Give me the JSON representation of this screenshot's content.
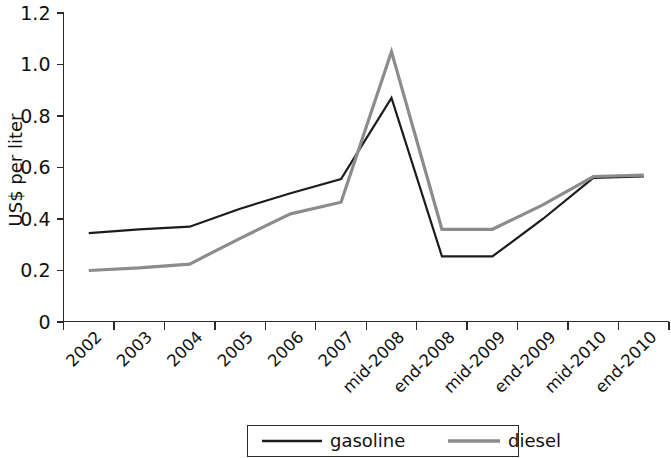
{
  "chart_data": {
    "type": "line",
    "title": "",
    "subtitle": "",
    "xlabel": "",
    "ylabel": "US$ per liter",
    "ylim": [
      0,
      1.2
    ],
    "yticks": [
      0,
      0.2,
      0.4,
      0.6,
      0.8,
      1.0,
      1.2
    ],
    "ytick_labels": [
      "0",
      "0.2",
      "0.4",
      "0.6",
      "0.8",
      "1.0",
      "1.2"
    ],
    "grid": false,
    "legend_position": "bottom-center",
    "categories": [
      "2002",
      "2003",
      "2004",
      "2005",
      "2006",
      "2007",
      "mid-2008",
      "end-2008",
      "mid-2009",
      "end-2009",
      "mid-2010",
      "end-2010"
    ],
    "series": [
      {
        "name": "gasoline",
        "color": "#1c1c1c",
        "values": [
          0.345,
          0.36,
          0.37,
          0.44,
          0.5,
          0.555,
          0.87,
          0.255,
          0.255,
          0.4,
          0.56,
          0.565
        ]
      },
      {
        "name": "diesel",
        "color": "#8c8c8c",
        "values": [
          0.2,
          0.21,
          0.225,
          0.325,
          0.42,
          0.465,
          1.05,
          0.36,
          0.36,
          0.455,
          0.565,
          0.57
        ]
      }
    ],
    "annotations": []
  },
  "legend": {
    "entries": [
      {
        "label": "gasoline",
        "color": "#1c1c1c"
      },
      {
        "label": "diesel",
        "color": "#8c8c8c"
      }
    ]
  },
  "axes": {
    "y_title": "US$ per liter"
  }
}
